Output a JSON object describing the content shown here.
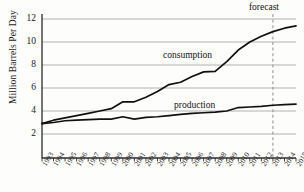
{
  "chart_data": {
    "type": "line",
    "title": "",
    "xlabel": "",
    "ylabel": "Million Barrels Per Day",
    "ylim": [
      0,
      12
    ],
    "yticks": [
      2,
      4,
      6,
      8,
      10,
      12
    ],
    "ytick_labels": [
      "2",
      "4",
      "6",
      "8",
      "10",
      "12"
    ],
    "grid": "horizontal",
    "legend": "inline-series-labels",
    "categories": [
      "1993",
      "1994",
      "1995",
      "1996",
      "1997",
      "1998",
      "1999",
      "2000",
      "2001",
      "2002",
      "2003",
      "2004",
      "2005",
      "2006",
      "2007",
      "2008",
      "2009",
      "2010",
      "2011",
      "2012",
      "2013",
      "2014",
      "2015"
    ],
    "series": [
      {
        "name": "consumption",
        "color": "#111111",
        "values": [
          2.9,
          3.2,
          3.4,
          3.6,
          3.8,
          4.0,
          4.2,
          4.8,
          4.8,
          5.2,
          5.7,
          6.3,
          6.5,
          7.0,
          7.4,
          7.45,
          8.3,
          9.3,
          10.0,
          10.5,
          10.9,
          11.2,
          11.4
        ]
      },
      {
        "name": "production",
        "color": "#111111",
        "values": [
          2.9,
          3.0,
          3.15,
          3.2,
          3.25,
          3.3,
          3.3,
          3.5,
          3.3,
          3.45,
          3.5,
          3.6,
          3.7,
          3.8,
          3.85,
          3.9,
          4.0,
          4.3,
          4.35,
          4.4,
          4.5,
          4.55,
          4.6
        ]
      }
    ],
    "annotations": [
      {
        "text": "forecast",
        "type": "vertical-divider-label",
        "at_category": "2013",
        "line_style": "dashed",
        "line_color": "#9a9a9a"
      },
      {
        "text": "consumption",
        "type": "series-inline-label",
        "series": "consumption"
      },
      {
        "text": "production",
        "type": "series-inline-label",
        "series": "production"
      }
    ]
  },
  "labels": {
    "y_axis_title": "Million Barrels Per Day",
    "forecast": "forecast",
    "consumption": "consumption",
    "production": "production"
  }
}
